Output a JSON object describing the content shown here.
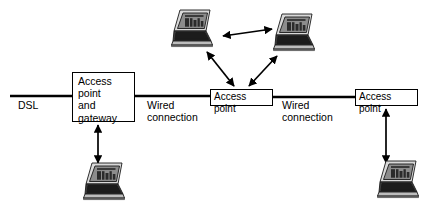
{
  "diagram": {
    "background_color": "#ffffff",
    "line_color": "#000000",
    "text_color": "#000000",
    "nodes": [
      {
        "id": "gateway",
        "label": "Access point\nand\ngateway",
        "shape": "rectangle",
        "x": 72,
        "y": 72,
        "w": 63,
        "h": 50
      },
      {
        "id": "ap-middle",
        "label": "Access point",
        "shape": "rectangle",
        "x": 210,
        "y": 89,
        "w": 63,
        "h": 17
      },
      {
        "id": "ap-right",
        "label": "Access point",
        "shape": "rectangle",
        "x": 355,
        "y": 89,
        "w": 63,
        "h": 17
      }
    ],
    "edge_labels": [
      {
        "id": "dsl",
        "label": "DSL",
        "x": 18,
        "y": 100
      },
      {
        "id": "wired-1",
        "label": "Wired\nconnection",
        "x": 147,
        "y": 98
      },
      {
        "id": "wired-2",
        "label": "Wired\nconnection",
        "x": 282,
        "y": 98
      }
    ],
    "laptops": [
      {
        "id": "laptop-top-left",
        "x": 166,
        "y": 7,
        "w": 52,
        "h": 42
      },
      {
        "id": "laptop-top-right",
        "x": 268,
        "y": 11,
        "w": 52,
        "h": 42
      },
      {
        "id": "laptop-bottom-left",
        "x": 78,
        "y": 160,
        "w": 52,
        "h": 42
      },
      {
        "id": "laptop-bottom-right",
        "x": 372,
        "y": 158,
        "w": 52,
        "h": 42
      }
    ],
    "connections": [
      {
        "id": "dsl-line",
        "type": "wire",
        "from": "dsl-edge",
        "to": "gateway"
      },
      {
        "id": "wire-1",
        "type": "wire",
        "from": "gateway",
        "to": "ap-middle"
      },
      {
        "id": "wire-2",
        "type": "wire",
        "from": "ap-middle",
        "to": "ap-right"
      },
      {
        "id": "wireless-gateway-laptop",
        "type": "wireless-bidirectional",
        "from": "gateway",
        "to": "laptop-bottom-left"
      },
      {
        "id": "wireless-apright-laptop",
        "type": "wireless-bidirectional",
        "from": "ap-right",
        "to": "laptop-bottom-right"
      },
      {
        "id": "wireless-apmid-topleft",
        "type": "wireless-bidirectional",
        "from": "ap-middle",
        "to": "laptop-top-left"
      },
      {
        "id": "wireless-apmid-topright",
        "type": "wireless-bidirectional",
        "from": "ap-middle",
        "to": "laptop-top-right"
      },
      {
        "id": "wireless-peer-to-peer",
        "type": "wireless-bidirectional",
        "from": "laptop-top-left",
        "to": "laptop-top-right"
      }
    ]
  }
}
